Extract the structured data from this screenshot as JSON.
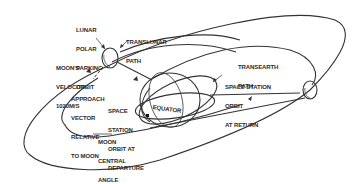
{
  "diagram": {
    "type": "lunar mission trajectory",
    "colors": {
      "line": "#333333",
      "background": "#ffffff",
      "text": "#2a2a2a"
    },
    "labels": {
      "lunar_polar_parking_orbit": [
        "LUNAR",
        "POLAR",
        "PARKING",
        "ORBIT"
      ],
      "translunar_path": [
        "TRANSLUNAR",
        "PATH"
      ],
      "moons_velocity": [
        "MOON'S",
        "VELOCITY",
        "1020M/S"
      ],
      "approach_vector": [
        "APPROACH",
        "VECTOR",
        "RELATIVE",
        "TO MOON"
      ],
      "space_station_departure": [
        "SPACE",
        "STATION",
        "ORBIT AT",
        "DEPARTURE"
      ],
      "equator": "EQUATOR",
      "transearth_path": [
        "TRANSEARTH",
        "PATH"
      ],
      "space_station_return": [
        "SPACE STATION",
        "ORBIT",
        "AT RETURN"
      ],
      "moon_central_angle": [
        "MOON",
        "CENTRAL",
        "ANGLE",
        "-210°"
      ]
    }
  }
}
